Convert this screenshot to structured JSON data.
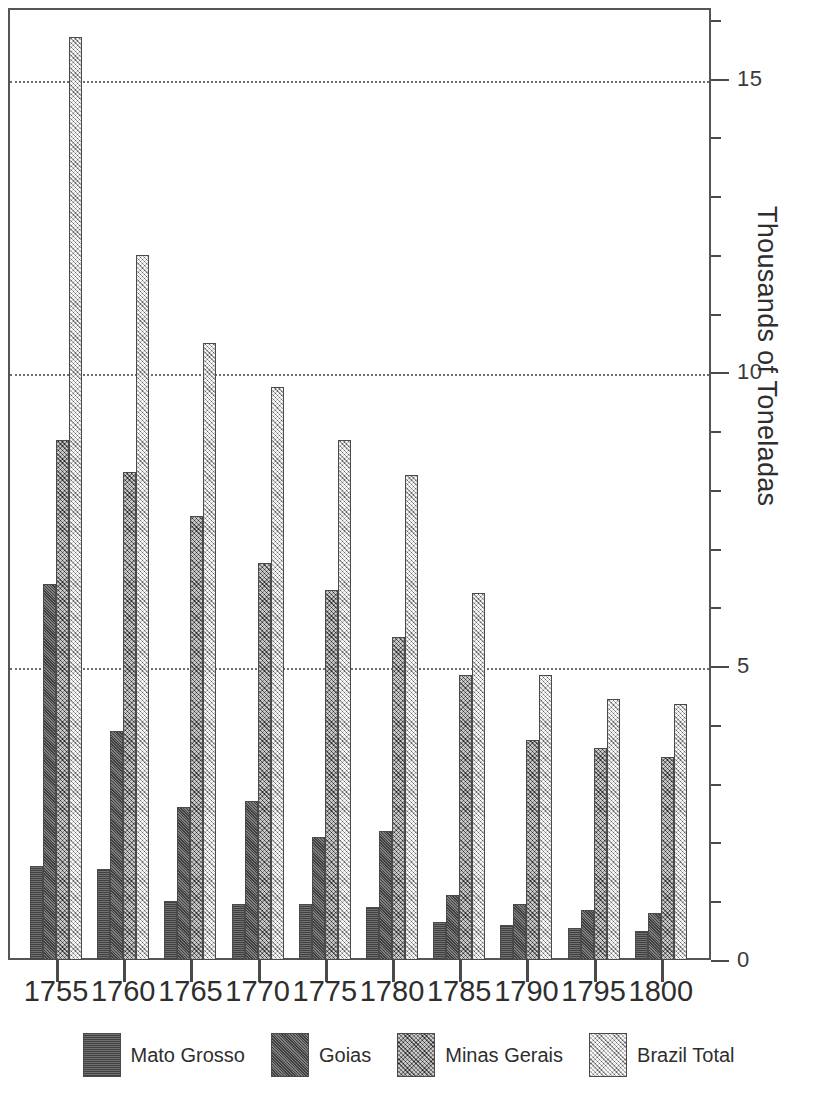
{
  "chart_data": {
    "type": "bar",
    "title": "",
    "subtitle": "",
    "xlabel": "",
    "ylabel": "Thousands of Toneladas",
    "categories": [
      "1755",
      "1760",
      "1765",
      "1770",
      "1775",
      "1780",
      "1785",
      "1790",
      "1795",
      "1800"
    ],
    "ylim": [
      0,
      16.2
    ],
    "yticks": [
      0,
      5,
      10,
      15
    ],
    "ytick_labels": [
      "0",
      "5",
      "10",
      "15"
    ],
    "minor_tick_interval": 1,
    "grid": "horizontal-dotted-at-major-ticks",
    "legend_position": "bottom",
    "series": [
      {
        "name": "Mato Grosso",
        "color": "#5d5d5d",
        "pattern": "dark-solid",
        "values": [
          1.6,
          1.55,
          1.0,
          0.95,
          0.95,
          0.9,
          0.65,
          0.6,
          0.55,
          0.5
        ]
      },
      {
        "name": "Goias",
        "color": "#616161",
        "pattern": "dark-hatch",
        "values": [
          6.4,
          3.9,
          2.6,
          2.7,
          2.1,
          2.2,
          1.1,
          0.95,
          0.85,
          0.8
        ]
      },
      {
        "name": "Minas Gerais",
        "color": "#8e8e8e",
        "pattern": "medium-crosshatch",
        "values": [
          8.85,
          8.3,
          7.55,
          6.75,
          6.3,
          5.5,
          4.85,
          3.75,
          3.6,
          3.45
        ]
      },
      {
        "name": "Brazil Total",
        "color": "#d9d9d9",
        "pattern": "light-crosshatch",
        "values": [
          15.7,
          12.0,
          10.5,
          9.75,
          8.85,
          8.25,
          6.25,
          4.85,
          4.45,
          4.35
        ]
      }
    ]
  },
  "axis": {
    "y_title": "Thousands of Toneladas",
    "y_labels": [
      "15",
      "10",
      "5",
      "0"
    ]
  },
  "legend": {
    "items": [
      {
        "label": "Mato Grosso"
      },
      {
        "label": "Goias"
      },
      {
        "label": "Minas Gerais"
      },
      {
        "label": "Brazil Total"
      }
    ]
  }
}
